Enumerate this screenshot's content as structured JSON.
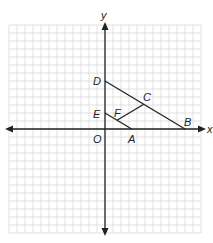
{
  "figure": {
    "type": "coordinate-geometry-diagram",
    "axes": {
      "x_label": "x",
      "y_label": "y",
      "origin_label": "O"
    },
    "grid": {
      "unit_px": 8,
      "x_range": [
        -12,
        12
      ],
      "y_range": [
        -13,
        13
      ],
      "color": "#d9d9d9"
    },
    "colors": {
      "axis": "#222222",
      "segment": "#222222"
    },
    "points": [
      {
        "label": "O",
        "x": 0,
        "y": 0
      },
      {
        "label": "A",
        "x": 3.33,
        "y": 0
      },
      {
        "label": "B",
        "x": 10,
        "y": 0
      },
      {
        "label": "C",
        "x": 4.85,
        "y": 3.1
      },
      {
        "label": "D",
        "x": 0,
        "y": 6
      },
      {
        "label": "E",
        "x": 0,
        "y": 2
      },
      {
        "label": "F",
        "x": 1.5,
        "y": 1.1
      }
    ],
    "segments": [
      {
        "from": "D",
        "to": "B"
      },
      {
        "from": "E",
        "to": "A"
      },
      {
        "from": "F",
        "to": "C"
      }
    ]
  },
  "labels": {
    "x": "x",
    "y": "y",
    "O": "O",
    "A": "A",
    "B": "B",
    "C": "C",
    "D": "D",
    "E": "E",
    "F": "F"
  }
}
